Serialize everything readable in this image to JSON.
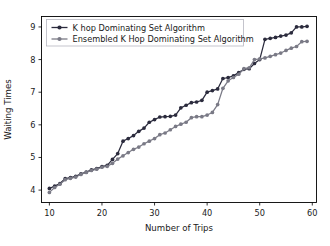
{
  "chart_data": {
    "type": "line",
    "title": "",
    "xlabel": "Number of Trips",
    "ylabel": "Waiting Times",
    "xlim": [
      8.5,
      60.8
    ],
    "ylim": [
      3.62,
      9.32
    ],
    "xticks": [
      10,
      20,
      30,
      40,
      50,
      60
    ],
    "yticks": [
      4,
      5,
      6,
      7,
      8,
      9
    ],
    "grid": false,
    "legend_position": "upper left",
    "series": [
      {
        "name": "K hop Dominating Set Algorithm",
        "color": "#2b2b3d",
        "marker": "circle",
        "x": [
          10,
          11,
          12,
          13,
          14,
          15,
          16,
          17,
          18,
          19,
          20,
          21,
          22,
          23,
          24,
          25,
          26,
          27,
          28,
          29,
          30,
          31,
          32,
          33,
          34,
          35,
          36,
          37,
          38,
          39,
          40,
          41,
          42,
          43,
          44,
          45,
          46,
          47,
          48,
          49,
          50,
          51,
          52,
          53,
          54,
          55,
          56,
          57,
          58,
          59
        ],
        "values": [
          4.05,
          4.12,
          4.2,
          4.35,
          4.38,
          4.42,
          4.5,
          4.55,
          4.62,
          4.66,
          4.72,
          4.76,
          4.94,
          5.12,
          5.5,
          5.58,
          5.67,
          5.8,
          5.9,
          6.08,
          6.16,
          6.24,
          6.25,
          6.26,
          6.3,
          6.52,
          6.6,
          6.68,
          6.7,
          6.75,
          7.0,
          7.05,
          7.1,
          7.42,
          7.45,
          7.5,
          7.6,
          7.7,
          7.72,
          7.88,
          8.0,
          8.62,
          8.65,
          8.68,
          8.72,
          8.75,
          8.82,
          9.0,
          9.0,
          9.02
        ]
      },
      {
        "name": "Ensembled K Hop Dominating Set Algorithm",
        "color": "#7a7a86",
        "marker": "circle",
        "x": [
          10,
          11,
          12,
          13,
          14,
          15,
          16,
          17,
          18,
          19,
          20,
          21,
          22,
          23,
          24,
          25,
          26,
          27,
          28,
          29,
          30,
          31,
          32,
          33,
          34,
          35,
          36,
          37,
          38,
          39,
          40,
          41,
          42,
          43,
          44,
          45,
          46,
          47,
          48,
          49,
          50,
          51,
          52,
          53,
          54,
          55,
          56,
          57,
          58,
          59
        ],
        "values": [
          3.93,
          4.08,
          4.18,
          4.32,
          4.36,
          4.4,
          4.48,
          4.54,
          4.6,
          4.64,
          4.7,
          4.73,
          4.82,
          4.95,
          5.05,
          5.15,
          5.25,
          5.32,
          5.42,
          5.5,
          5.58,
          5.7,
          5.75,
          5.85,
          5.95,
          6.02,
          6.08,
          6.22,
          6.25,
          6.25,
          6.3,
          6.38,
          6.62,
          7.12,
          7.35,
          7.45,
          7.55,
          7.72,
          7.75,
          8.0,
          8.02,
          8.05,
          8.1,
          8.15,
          8.2,
          8.28,
          8.35,
          8.4,
          8.55,
          8.56
        ]
      }
    ]
  },
  "legend": {
    "entries": [
      {
        "label": "K hop Dominating Set Algorithm"
      },
      {
        "label": "Ensembled K Hop Dominating Set Algorithm"
      }
    ]
  },
  "axes": {
    "x_title": "Number of Trips",
    "y_title": "Waiting Times",
    "x_tick_labels": [
      "10",
      "20",
      "30",
      "40",
      "50",
      "60"
    ],
    "y_tick_labels": [
      "4",
      "5",
      "6",
      "7",
      "8",
      "9"
    ]
  },
  "colors": {
    "series1": "#2b2b3d",
    "series2": "#7a7a86",
    "axis": "#000000",
    "background": "#ffffff"
  }
}
